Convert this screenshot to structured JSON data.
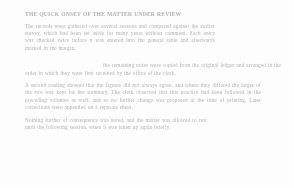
{
  "page": {
    "background_color": "#ffffff",
    "text_color": "#eeeff1",
    "note": "Extremely faded / low-contrast scanned text page"
  },
  "document": {
    "heading": "THE QUICK ONSET OF THE MATTER UNDER REVIEW",
    "blocks": [
      {
        "id": "block-a",
        "role": "opening-paragraph",
        "text": "The records were gathered over several seasons and compared against the earlier survey, which had been set aside for many years without comment. Each entry was checked twice before it was entered into the general table and afterwards marked in the margin."
      },
      {
        "id": "block-b",
        "role": "continuation-line",
        "text": "the remaining notes were copied from the original ledger and arranged in the order in which they were first received by the office of the clerk."
      },
      {
        "id": "block-c",
        "role": "body-paragraph",
        "text": "A second reading showed that the figures did not always agree, and where they differed the larger of the two was kept for the summary. The clerk observed that this practice had been followed in the preceding volumes as well, and so no further change was proposed at the time of printing. Later corrections were appended on a separate sheet."
      },
      {
        "id": "block-d",
        "role": "closing-paragraph",
        "text": "Nothing further of consequence was noted, and the matter was allowed to rest until the following session, when it was taken up again briefly."
      }
    ]
  }
}
